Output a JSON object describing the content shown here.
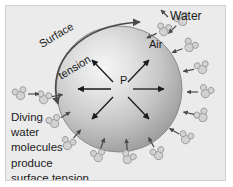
{
  "figure": {
    "background_color": "#ebebeb",
    "frame_color": "#cfcfcf",
    "page_color": "#ffffff"
  },
  "labels": {
    "air": "Air",
    "water": "Water",
    "pressure": "P",
    "surface_tension_line1": "Surface",
    "surface_tension_line2": "tension",
    "caption_line1": "Diving",
    "caption_line2": "water",
    "caption_line3": "molecules",
    "caption_line4": "produce",
    "caption_line5": "surface tension"
  },
  "sphere": {
    "name": "air-bubble",
    "center_x": 113,
    "center_y": 83,
    "radius": 63,
    "highlight_x": 88,
    "highlight_y": 52,
    "color_light": "#f2f2f2",
    "color_mid": "#c8c8c8",
    "color_edge": "#8d8d8d",
    "outline_color": "#7a7a7a"
  },
  "pressure_arrows": {
    "name": "internal-pressure-arrows",
    "count": 6,
    "color": "#1a1a1a",
    "directions": [
      "left",
      "right",
      "up-left",
      "up-right",
      "down-left",
      "down-right"
    ],
    "length": 34
  },
  "surface_tension_arrow": {
    "name": "surface-tension-curved-arrow",
    "color": "#4a4a4a",
    "double_headed": true,
    "start": "upper-right",
    "end": "lower-left"
  },
  "molecule_style": {
    "fill": "#d2d2d2",
    "stroke": "#9a9a9a",
    "big_radius": 4.2,
    "small_radius": 3.0,
    "arrow_color": "#4a4a4a"
  },
  "molecules": [
    {
      "x": 158,
      "y": 24,
      "rot": 10,
      "arrow_angle": 205,
      "label": "water-molecule-top-right-1"
    },
    {
      "x": 176,
      "y": 14,
      "rot": -25,
      "arrow_angle": 225,
      "label": "water-molecule-top-right-2"
    },
    {
      "x": 184,
      "y": 40,
      "rot": 30,
      "arrow_angle": 200,
      "label": "water-molecule-right-upper"
    },
    {
      "x": 196,
      "y": 62,
      "rot": -15,
      "arrow_angle": 190,
      "label": "water-molecule-right-1"
    },
    {
      "x": 200,
      "y": 86,
      "rot": 20,
      "arrow_angle": 180,
      "label": "water-molecule-right-2"
    },
    {
      "x": 196,
      "y": 110,
      "rot": -30,
      "arrow_angle": 168,
      "label": "water-molecule-right-3"
    },
    {
      "x": 180,
      "y": 132,
      "rot": 15,
      "arrow_angle": 150,
      "label": "water-molecule-lower-right"
    },
    {
      "x": 152,
      "y": 148,
      "rot": -20,
      "arrow_angle": 120,
      "label": "water-molecule-bottom-1"
    },
    {
      "x": 122,
      "y": 152,
      "rot": 25,
      "arrow_angle": 95,
      "label": "water-molecule-bottom-2"
    },
    {
      "x": 92,
      "y": 150,
      "rot": -10,
      "arrow_angle": 70,
      "label": "water-molecule-bottom-3"
    },
    {
      "x": 62,
      "y": 138,
      "rot": 18,
      "arrow_angle": 48,
      "label": "water-molecule-lower-left-1"
    },
    {
      "x": 48,
      "y": 116,
      "rot": -22,
      "arrow_angle": 32,
      "label": "water-molecule-lower-left-2"
    },
    {
      "x": 38,
      "y": 92,
      "rot": 12,
      "arrow_angle": 10,
      "label": "water-molecule-left-1"
    },
    {
      "x": 14,
      "y": 88,
      "rot": -18,
      "arrow_angle": 0,
      "label": "water-molecule-far-left"
    }
  ]
}
